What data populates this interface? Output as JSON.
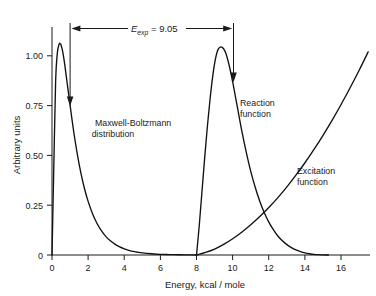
{
  "chart_data": {
    "type": "line",
    "title": "",
    "xlabel": "Energy, kcal / mole",
    "ylabel": "Arbitrary units",
    "xlim": [
      0,
      17.6
    ],
    "ylim": [
      0,
      1.08
    ],
    "grid": false,
    "legend_position": "inline-annotations",
    "x_ticks": [
      0,
      2,
      4,
      6,
      8,
      10,
      12,
      14,
      16
    ],
    "x_tick_labels": [
      "0",
      "2",
      "4",
      "6",
      "8",
      "10",
      "12",
      "14",
      "16"
    ],
    "y_ticks": [
      0,
      0.25,
      0.5,
      0.75,
      1.0
    ],
    "y_tick_labels": [
      "0",
      "0.25",
      "0.50",
      "0.75",
      "1.00"
    ],
    "series": [
      {
        "name": "Maxwell-Boltzmann distribution",
        "label_line1": "Maxwell-Boltzmann",
        "label_line2": "distribution",
        "peak_x": 0.45,
        "peak_y": 1.0,
        "x": [
          0,
          0.1,
          0.2,
          0.3,
          0.4,
          0.45,
          0.5,
          0.6,
          0.7,
          0.8,
          0.9,
          1.0,
          1.2,
          1.4,
          1.6,
          1.8,
          2.0,
          2.25,
          2.5,
          2.75,
          3.0,
          3.25,
          3.5,
          3.75,
          4.0,
          4.25,
          4.5,
          4.75,
          5.0,
          5.5,
          6.0,
          6.5,
          7.0,
          7.5,
          8.0
        ],
        "y": [
          0,
          0.42,
          0.82,
          0.96,
          1.0,
          1.0,
          0.995,
          0.96,
          0.905,
          0.84,
          0.775,
          0.71,
          0.585,
          0.478,
          0.388,
          0.314,
          0.254,
          0.194,
          0.148,
          0.113,
          0.086,
          0.066,
          0.05,
          0.038,
          0.029,
          0.022,
          0.017,
          0.013,
          0.01,
          0.006,
          0.003,
          0.002,
          0.001,
          0.0005,
          0.0
        ]
      },
      {
        "name": "Reaction function",
        "label_line1": "Reaction",
        "label_line2": "function",
        "peak_x": 9.4,
        "peak_y": 0.985,
        "x": [
          8.0,
          8.15,
          8.3,
          8.45,
          8.6,
          8.75,
          8.9,
          9.05,
          9.2,
          9.4,
          9.6,
          9.8,
          10.0,
          10.25,
          10.5,
          10.75,
          11.0,
          11.25,
          11.5,
          11.75,
          12.0,
          12.25,
          12.5,
          12.75,
          13.0,
          13.25,
          13.5,
          13.75,
          14.0,
          14.25,
          14.5,
          14.75,
          15.0,
          15.3
        ],
        "y": [
          0,
          0.14,
          0.3,
          0.46,
          0.61,
          0.74,
          0.85,
          0.93,
          0.975,
          0.985,
          0.96,
          0.9,
          0.82,
          0.705,
          0.59,
          0.487,
          0.396,
          0.32,
          0.255,
          0.2,
          0.156,
          0.12,
          0.09,
          0.067,
          0.049,
          0.035,
          0.024,
          0.016,
          0.01,
          0.006,
          0.003,
          0.0015,
          0.0005,
          0.0
        ]
      },
      {
        "name": "Excitation function",
        "label_line1": "Excitation",
        "label_line2": "function",
        "x": [
          8.0,
          8.5,
          9.0,
          9.5,
          10.0,
          10.5,
          11.0,
          11.5,
          12.0,
          12.5,
          13.0,
          13.5,
          14.0,
          14.5,
          15.0,
          15.5,
          16.0,
          16.5,
          17.0,
          17.5
        ],
        "y": [
          0,
          0.012,
          0.028,
          0.05,
          0.077,
          0.108,
          0.143,
          0.182,
          0.225,
          0.272,
          0.323,
          0.378,
          0.437,
          0.5,
          0.567,
          0.638,
          0.713,
          0.792,
          0.875,
          0.962
        ]
      }
    ],
    "annotations": [
      {
        "name": "e-exp-span",
        "symbol": "E",
        "subscript": "exp",
        "equals": " = ",
        "value": "9.05",
        "full_text": "E_exp = 9.05",
        "from_x": 1.0,
        "to_x": 10.05,
        "marker_drop_left_to_y": 0.76,
        "marker_drop_right_to_y": 0.885
      }
    ]
  }
}
